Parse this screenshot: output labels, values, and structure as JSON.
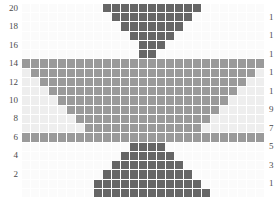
{
  "chart_data": {
    "type": "heatmap",
    "title": "",
    "xlabel": "",
    "ylabel": "",
    "rows": 21,
    "columns": 27,
    "grid_line_color": "#ffffff",
    "legend_position": "none",
    "palette": {
      "empty": "#fbfbfb",
      "background": "#f2f2f2",
      "light": "#ededed",
      "medium": "#9a9a9a",
      "dark": "#666666",
      "darkest": "#3d3d3d"
    },
    "value_levels": [
      0,
      1,
      2,
      3
    ],
    "level_colors": [
      "#fbfbfb",
      "#eeeeee",
      "#9a9a9a",
      "#666666"
    ],
    "row_labels_left": [
      "20",
      "18",
      "16",
      "14",
      "12",
      "10",
      "8",
      "6",
      "4",
      "2"
    ],
    "row_labels_right": [
      "1",
      "1",
      "1",
      "1",
      "1",
      "9",
      "7",
      "5",
      "3",
      "1"
    ],
    "row_labels_right_full": [
      "19",
      "17",
      "15",
      "13",
      "11",
      "9",
      "7",
      "5",
      "3",
      "1"
    ],
    "matrix": [
      [
        0,
        0,
        0,
        0,
        0,
        0,
        0,
        0,
        0,
        3,
        3,
        3,
        3,
        3,
        3,
        3,
        3,
        3,
        3,
        3,
        0,
        0,
        0,
        0,
        0,
        0,
        0
      ],
      [
        0,
        0,
        0,
        0,
        0,
        0,
        0,
        0,
        0,
        0,
        3,
        3,
        3,
        3,
        3,
        3,
        3,
        3,
        3,
        0,
        0,
        0,
        0,
        0,
        0,
        0,
        0
      ],
      [
        0,
        0,
        0,
        0,
        0,
        0,
        0,
        0,
        0,
        0,
        0,
        3,
        3,
        3,
        3,
        3,
        3,
        3,
        0,
        0,
        0,
        0,
        0,
        0,
        0,
        0,
        0
      ],
      [
        0,
        0,
        0,
        0,
        0,
        0,
        0,
        0,
        0,
        0,
        0,
        0,
        3,
        3,
        3,
        3,
        3,
        0,
        0,
        0,
        0,
        0,
        0,
        0,
        0,
        0,
        0
      ],
      [
        0,
        0,
        0,
        0,
        0,
        0,
        0,
        0,
        0,
        0,
        0,
        0,
        0,
        3,
        3,
        3,
        0,
        0,
        0,
        0,
        0,
        0,
        0,
        0,
        0,
        0,
        0
      ],
      [
        0,
        0,
        0,
        0,
        0,
        0,
        0,
        0,
        0,
        0,
        0,
        0,
        0,
        3,
        3,
        0,
        0,
        0,
        0,
        0,
        0,
        0,
        0,
        0,
        0,
        0,
        0
      ],
      [
        2,
        2,
        2,
        2,
        2,
        2,
        2,
        2,
        2,
        2,
        2,
        2,
        2,
        2,
        2,
        2,
        2,
        2,
        2,
        2,
        2,
        2,
        2,
        2,
        2,
        2,
        2
      ],
      [
        1,
        2,
        2,
        2,
        2,
        2,
        2,
        2,
        2,
        2,
        2,
        2,
        2,
        2,
        2,
        2,
        2,
        2,
        2,
        2,
        2,
        2,
        2,
        2,
        2,
        2,
        1
      ],
      [
        1,
        1,
        2,
        2,
        2,
        2,
        2,
        2,
        2,
        2,
        2,
        2,
        2,
        2,
        2,
        2,
        2,
        2,
        2,
        2,
        2,
        2,
        2,
        2,
        2,
        1,
        1
      ],
      [
        1,
        1,
        1,
        2,
        2,
        2,
        2,
        2,
        2,
        2,
        2,
        2,
        2,
        2,
        2,
        2,
        2,
        2,
        2,
        2,
        2,
        2,
        2,
        2,
        1,
        1,
        1
      ],
      [
        1,
        1,
        1,
        1,
        2,
        2,
        2,
        2,
        2,
        2,
        2,
        2,
        2,
        2,
        2,
        2,
        2,
        2,
        2,
        2,
        2,
        2,
        2,
        1,
        1,
        1,
        1
      ],
      [
        1,
        1,
        1,
        1,
        1,
        2,
        2,
        2,
        2,
        2,
        2,
        2,
        2,
        2,
        2,
        2,
        2,
        2,
        2,
        2,
        2,
        2,
        1,
        1,
        1,
        1,
        1
      ],
      [
        1,
        1,
        1,
        1,
        1,
        1,
        2,
        2,
        2,
        2,
        2,
        2,
        2,
        2,
        2,
        2,
        2,
        2,
        2,
        2,
        2,
        1,
        1,
        1,
        1,
        1,
        1
      ],
      [
        1,
        1,
        1,
        1,
        1,
        1,
        1,
        2,
        2,
        2,
        2,
        2,
        2,
        2,
        2,
        2,
        2,
        2,
        2,
        2,
        1,
        1,
        1,
        1,
        1,
        1,
        1
      ],
      [
        2,
        2,
        2,
        2,
        2,
        2,
        2,
        2,
        2,
        2,
        2,
        2,
        2,
        2,
        2,
        2,
        2,
        2,
        2,
        2,
        2,
        2,
        2,
        2,
        2,
        2,
        2
      ],
      [
        0,
        0,
        0,
        0,
        0,
        0,
        0,
        0,
        0,
        0,
        0,
        0,
        3,
        3,
        3,
        3,
        0,
        0,
        0,
        0,
        0,
        0,
        0,
        0,
        0,
        0,
        0
      ],
      [
        0,
        0,
        0,
        0,
        0,
        0,
        0,
        0,
        0,
        0,
        0,
        3,
        3,
        3,
        3,
        3,
        3,
        0,
        0,
        0,
        0,
        0,
        0,
        0,
        0,
        0,
        0
      ],
      [
        0,
        0,
        0,
        0,
        0,
        0,
        0,
        0,
        0,
        0,
        3,
        3,
        3,
        3,
        3,
        3,
        3,
        3,
        0,
        0,
        0,
        0,
        0,
        0,
        0,
        0,
        0
      ],
      [
        0,
        0,
        0,
        0,
        0,
        0,
        0,
        0,
        0,
        3,
        3,
        3,
        3,
        3,
        3,
        3,
        3,
        3,
        3,
        0,
        0,
        0,
        0,
        0,
        0,
        0,
        0
      ],
      [
        0,
        0,
        0,
        0,
        0,
        0,
        0,
        0,
        3,
        3,
        3,
        3,
        3,
        3,
        3,
        3,
        3,
        3,
        3,
        3,
        0,
        0,
        0,
        0,
        0,
        0,
        0
      ],
      [
        0,
        0,
        0,
        0,
        0,
        0,
        0,
        0,
        3,
        3,
        3,
        3,
        3,
        3,
        3,
        3,
        3,
        3,
        3,
        3,
        3,
        0,
        0,
        0,
        0,
        0,
        0
      ]
    ]
  }
}
